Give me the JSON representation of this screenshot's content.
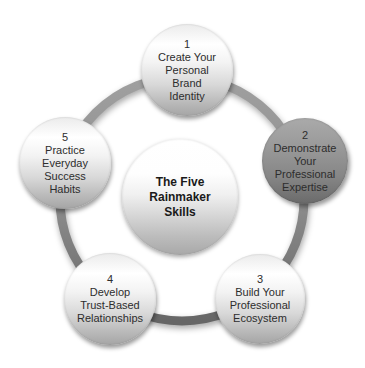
{
  "diagram": {
    "hub": {
      "lines": [
        "The Five",
        "Rainmaker",
        "Skills"
      ]
    },
    "nodes": [
      {
        "number": "1",
        "lines": [
          "Create Your",
          "Personal",
          "Brand",
          "Identity"
        ],
        "style": "light"
      },
      {
        "number": "2",
        "lines": [
          "Demonstrate",
          "Your",
          "Professional",
          "Expertise"
        ],
        "style": "dark"
      },
      {
        "number": "3",
        "lines": [
          "Build Your",
          "Professional",
          "Ecosystem"
        ],
        "style": "light"
      },
      {
        "number": "4",
        "lines": [
          "Develop",
          "Trust-Based",
          "Relationships"
        ],
        "style": "light"
      },
      {
        "number": "5",
        "lines": [
          "Practice",
          "Everyday",
          "Success",
          "Habits"
        ],
        "style": "light"
      }
    ],
    "colors": {
      "background": "#ffffff",
      "ring_top": "#a0a0a0",
      "ring_bottom": "#666666",
      "node_light_top": "#ffffff",
      "node_light_bottom": "#a5a5a5",
      "node_dark_top": "#aaaaaa",
      "node_dark_bottom": "#6a6a6a",
      "text": "#2d2d2d"
    }
  }
}
